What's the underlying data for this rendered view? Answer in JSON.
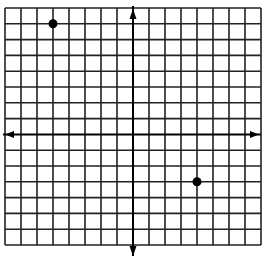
{
  "chart_data": {
    "type": "scatter",
    "title": "",
    "xlabel": "",
    "ylabel": "",
    "xlim": [
      -8,
      8
    ],
    "ylim": [
      -7,
      8
    ],
    "grid": true,
    "grid_step": 1,
    "axes_arrows": true,
    "points": [
      {
        "x": -5,
        "y": 7
      },
      {
        "x": 4,
        "y": -3
      }
    ],
    "colors": {
      "grid": "#222222",
      "axis": "#000000",
      "point": "#000000",
      "background": "#ffffff"
    }
  }
}
